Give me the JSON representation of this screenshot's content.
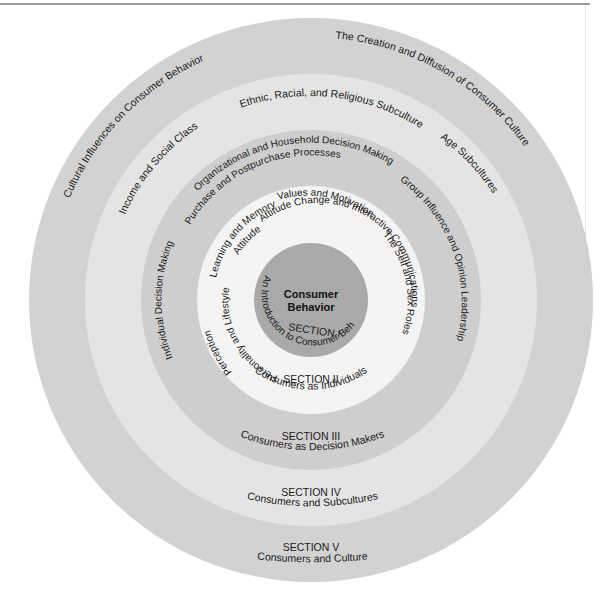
{
  "diagram": {
    "center": {
      "title_line1": "Consumer",
      "title_line2": "Behavior"
    },
    "colors": {
      "ring_v": "#d2d2d2",
      "ring_iv": "#e4e4e4",
      "ring_iii": "#cecece",
      "ring_ii": "#f4f4f4",
      "core": "#a9a9a9"
    },
    "sections": [
      {
        "id": "section-i",
        "label": "SECTION I",
        "title": "An Introduction to Consumer Behavior",
        "topics": []
      },
      {
        "id": "section-ii",
        "label": "SECTION II",
        "title": "Consumers as Individuals",
        "topics": [
          "Values and Motivation",
          "Attitude Change and Interactive Communications",
          "Learning and Memory",
          "Attitudes",
          "Personality and Lifestyles",
          "Perception",
          "The Self and Sex Roles"
        ]
      },
      {
        "id": "section-iii",
        "label": "SECTION III",
        "title": "Consumers as Decision Makers",
        "topics": [
          "Organizational and Household Decision Making",
          "Purchase and Postpurchase Processes",
          "Individual Decision Making",
          "Group Influence and Opinion Leadership"
        ]
      },
      {
        "id": "section-iv",
        "label": "SECTION IV",
        "title": "Consumers and Subcultures",
        "topics": [
          "Income and Social Class",
          "Ethnic, Racial, and Religious Subcultures",
          "Age Subcultures"
        ]
      },
      {
        "id": "section-v",
        "label": "SECTION V",
        "title": "Consumers and Culture",
        "topics": [
          "Cultural Influences on Consumer Behavior",
          "The Creation and Diffusion of Consumer Culture"
        ]
      }
    ]
  }
}
